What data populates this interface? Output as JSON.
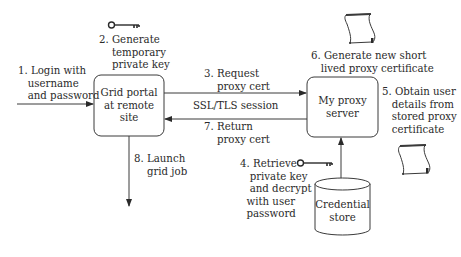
{
  "diagram": {
    "nodes": {
      "grid_portal": {
        "label": "Grid portal\nat remote\nsite"
      },
      "proxy_server": {
        "label": "My proxy\nserver"
      },
      "credential_store": {
        "label": "Credential\nstore"
      }
    },
    "steps": {
      "s1": "1. Login with\n   username\n   and password",
      "s2": "2. Generate\n    temporary\n    private key",
      "s3": "3. Request\n    proxy cert",
      "ssl": "SSL/TLS session",
      "s4": "4. Retrieve\n   private key\n   and decrypt\n  with user\n  password",
      "s5": "5. Obtain user\n   details from\n   stored proxy\n   certificate",
      "s6": "6. Generate new short\n   lived proxy certificate",
      "s7": "7. Return\n    proxy cert",
      "s8": "8. Launch\n    grid job"
    },
    "icons": [
      "key-icon",
      "key-icon",
      "certificate-scroll-icon",
      "certificate-scroll-icon"
    ],
    "colors": {
      "stroke": "#3a3a3a",
      "text": "#2a2a2a",
      "background": "#ffffff"
    }
  }
}
